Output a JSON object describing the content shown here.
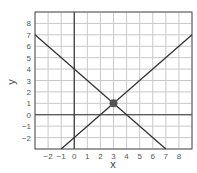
{
  "chart_data": {
    "type": "line",
    "title": "",
    "xlabel": "x",
    "ylabel": "y",
    "xlim": [
      -3,
      9
    ],
    "ylim": [
      -3,
      9
    ],
    "grid": true,
    "x_ticks": [
      -2,
      -1,
      0,
      1,
      2,
      3,
      4,
      5,
      6,
      7,
      8
    ],
    "y_ticks": [
      -2,
      -1,
      0,
      1,
      2,
      3,
      4,
      5,
      6,
      7,
      8
    ],
    "series": [
      {
        "name": "y = -x + 4",
        "points": [
          [
            -3,
            7
          ],
          [
            7,
            -3
          ]
        ]
      },
      {
        "name": "y = x - 2",
        "points": [
          [
            -1,
            -3
          ],
          [
            9,
            7
          ]
        ]
      }
    ],
    "annotations": [
      {
        "type": "point",
        "x": 3,
        "y": 1,
        "label": "intersection"
      }
    ],
    "colors": {
      "line": "#333333",
      "grid": "#c8c8c8",
      "axis": "#333333",
      "frame": "#555555",
      "point": "#555555"
    }
  }
}
